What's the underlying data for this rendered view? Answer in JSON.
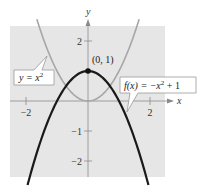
{
  "chart_data": {
    "type": "line",
    "title": "",
    "xlabel": "x",
    "ylabel": "y",
    "xlim": [
      -2.5,
      2.5
    ],
    "ylim": [
      -2.5,
      2.5
    ],
    "x_ticks": [
      -2,
      2
    ],
    "y_ticks": [
      2,
      -1,
      -2
    ],
    "x_tick_labels": [
      "−2",
      "2"
    ],
    "y_tick_labels": [
      "2",
      "−1",
      "−2"
    ],
    "grid": false,
    "background": "#e6e6e6",
    "series": [
      {
        "name": "y = x^2",
        "label": "y = x",
        "label_sup": "2",
        "color": "#a6a6a6",
        "formula": "x^2",
        "x": [
          -1.6,
          -1.2,
          -0.8,
          -0.4,
          0,
          0.4,
          0.8,
          1.2,
          1.6
        ],
        "values": [
          2.56,
          1.44,
          0.64,
          0.16,
          0,
          0.16,
          0.64,
          1.44,
          2.56
        ]
      },
      {
        "name": "f(x) = -x^2 + 1",
        "label_pre": "f(x) = −x",
        "label_sup": "2",
        "label_post": " + 1",
        "color": "#1a1a1a",
        "formula": "-x^2+1",
        "x": [
          -1.9,
          -1.5,
          -1,
          -0.5,
          0,
          0.5,
          1,
          1.5,
          1.9
        ],
        "values": [
          -2.61,
          -1.25,
          0,
          0.75,
          1,
          0.75,
          0,
          -1.25,
          -2.61
        ]
      }
    ],
    "annotations": [
      {
        "text": "(0, 1)",
        "x": 0,
        "y": 1,
        "marker": "point"
      }
    ]
  }
}
